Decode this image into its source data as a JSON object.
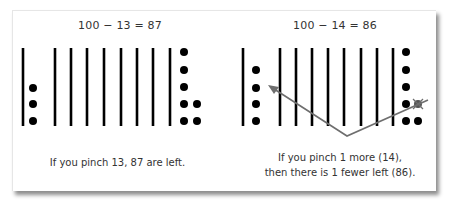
{
  "panels": [
    {
      "equation": "100 − 13 = 87",
      "caption_lines": [
        "If you pinch 13, 87 are left."
      ],
      "tens_bars": 9,
      "units_left_column": 3,
      "units_right_group": 7
    },
    {
      "equation": "100 − 14 = 86",
      "caption_lines": [
        "If you pinch 1 more (14),",
        "then there is 1 fewer left (86)."
      ],
      "tens_bars": 9,
      "units_left_column": 4,
      "units_right_group": 7,
      "crossed_out_unit": 1
    }
  ],
  "colors": {
    "ink": "#000000",
    "text": "#333333",
    "arrow": "#6e6e6e",
    "card_border": "#e6e6e6"
  }
}
